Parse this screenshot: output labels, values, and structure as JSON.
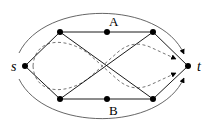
{
  "diagram": {
    "type": "graph",
    "nodes": [
      {
        "id": "s",
        "label": "s",
        "x": 25,
        "y": 66
      },
      {
        "id": "tl",
        "label": "",
        "x": 60,
        "y": 32
      },
      {
        "id": "A",
        "label": "A",
        "x": 107,
        "y": 32
      },
      {
        "id": "tr",
        "label": "",
        "x": 153,
        "y": 32
      },
      {
        "id": "bl",
        "label": "",
        "x": 60,
        "y": 99
      },
      {
        "id": "B",
        "label": "B",
        "x": 107,
        "y": 99
      },
      {
        "id": "br",
        "label": "",
        "x": 153,
        "y": 99
      },
      {
        "id": "t",
        "label": "t",
        "x": 188,
        "y": 66
      }
    ],
    "edges": [
      [
        "s",
        "tl"
      ],
      [
        "s",
        "bl"
      ],
      [
        "tl",
        "A"
      ],
      [
        "A",
        "tr"
      ],
      [
        "bl",
        "B"
      ],
      [
        "B",
        "br"
      ],
      [
        "tl",
        "br"
      ],
      [
        "bl",
        "tr"
      ],
      [
        "tr",
        "t"
      ],
      [
        "br",
        "t"
      ]
    ],
    "labels": {
      "s": "s",
      "t": "t",
      "A": "A",
      "B": "B"
    },
    "colors": {
      "line": "#000000",
      "outer_curve": "#555555",
      "dashed": "#666666"
    }
  }
}
